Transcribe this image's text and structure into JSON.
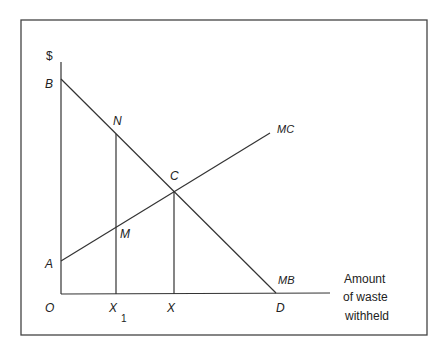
{
  "caption": "waste withholding and marginal costs/benefits (partially cut off)",
  "diagram": {
    "y_axis_label": "$",
    "x_axis_label_lines": [
      "Amount",
      "of waste",
      "withheld"
    ],
    "points": {
      "origin": "O",
      "B": "B",
      "A": "A",
      "N": "N",
      "M": "M",
      "C": "C",
      "X1_base": "X",
      "X1_sub": "1",
      "X": "X",
      "D": "D"
    },
    "curves": {
      "marginal_cost": "MC",
      "marginal_benefit": "MB"
    },
    "colors": {
      "line": "#333333",
      "frame": "#444444",
      "text": "#222222"
    }
  }
}
